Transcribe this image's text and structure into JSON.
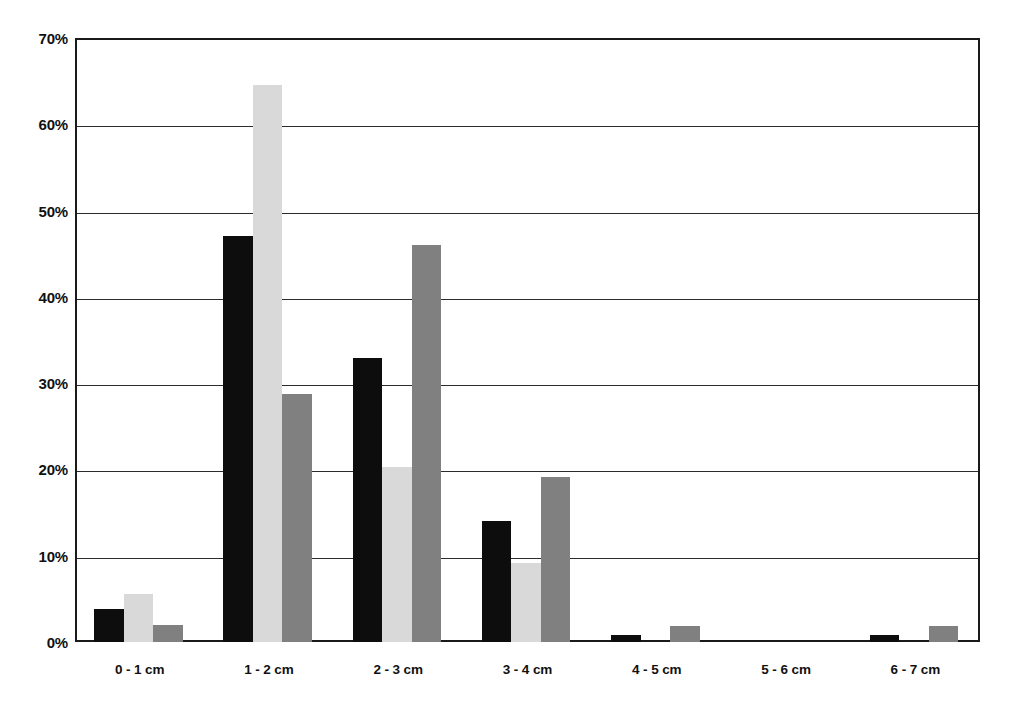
{
  "chart_data": {
    "type": "bar",
    "title": "",
    "subtitle": "",
    "xlabel": "",
    "ylabel": "",
    "categories": [
      "0 - 1 cm",
      "1 - 2 cm",
      "2 - 3 cm",
      "3 - 4 cm",
      "4 - 5 cm",
      "5 - 6 cm",
      "6 - 7 cm"
    ],
    "series": [
      {
        "name": "series-1",
        "color": "#0d0d0d",
        "values": [
          3.8,
          47.0,
          32.9,
          14.0,
          0.8,
          0.0,
          0.8
        ]
      },
      {
        "name": "series-2",
        "color": "#d9d9d9",
        "values": [
          5.6,
          64.5,
          20.3,
          9.1,
          0.0,
          0.0,
          0.0
        ]
      },
      {
        "name": "series-3",
        "color": "#808080",
        "values": [
          2.0,
          28.7,
          46.0,
          19.1,
          1.8,
          0.0,
          1.8
        ]
      }
    ],
    "ylim": [
      0,
      70
    ],
    "ytick_step": 10,
    "ytick_labels": [
      "0%",
      "10%",
      "20%",
      "30%",
      "40%",
      "50%",
      "60%",
      "70%"
    ],
    "ytick_values": [
      0,
      10,
      20,
      30,
      40,
      50,
      60,
      70
    ],
    "grid": true,
    "grid_axis": "y",
    "legend": false,
    "legend_position": "none",
    "value_suffix": "%",
    "plot_border_color": "#1a1a1a",
    "grid_color": "#2b2b2b",
    "background_color": "#ffffff"
  }
}
